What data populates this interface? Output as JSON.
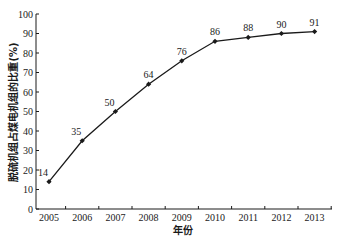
{
  "chart_data": {
    "type": "line",
    "title": "",
    "xlabel": "年份",
    "ylabel": "脱硫机组占煤电机组的比重(%)",
    "categories": [
      "2005",
      "2006",
      "2007",
      "2008",
      "2009",
      "2010",
      "2011",
      "2012",
      "2013"
    ],
    "series": [
      {
        "name": "脱硫机组占煤电机组的比重",
        "values": [
          14,
          35,
          50,
          64,
          76,
          86,
          88,
          90,
          91
        ],
        "marker": "diamond",
        "color": "#1a1a1a"
      }
    ],
    "ylim": [
      0,
      100
    ],
    "yticks": [
      0,
      10,
      20,
      30,
      40,
      50,
      60,
      70,
      80,
      90,
      100
    ],
    "grid": false,
    "legend": "none",
    "data_labels": true
  }
}
